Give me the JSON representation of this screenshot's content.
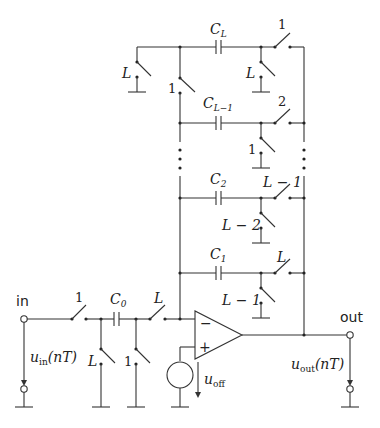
{
  "diagram": {
    "terminals": {
      "input_label": "in",
      "output_label": "out"
    },
    "signals": {
      "u_in": {
        "base": "u",
        "sub": "in",
        "arg": "(nT)"
      },
      "u_out": {
        "base": "u",
        "sub": "out",
        "arg": "(nT)"
      },
      "u_off": {
        "base": "u",
        "sub": "off"
      }
    },
    "capacitors": {
      "C0": {
        "base": "C",
        "sub": "0"
      },
      "C1": {
        "base": "C",
        "sub": "1"
      },
      "C2": {
        "base": "C",
        "sub": "2"
      },
      "CLm1": {
        "base": "C",
        "sub": "L−1"
      },
      "CL": {
        "base": "C",
        "sub": "L"
      }
    },
    "switch_labels": {
      "in_series": "1",
      "c0_out_series": "L",
      "c0_left_shunt": "L",
      "c0_right_shunt": "1",
      "cl_left_shunt": "L",
      "cl_mid_switch": "1",
      "cl_right_shunt": "L",
      "cl_series": "1",
      "clm1_series": "2",
      "clm1_shunt": "1",
      "c2_series": "L − 1",
      "c2_shunt": "L − 2",
      "c1_series": "L",
      "c1_shunt": "L − 1"
    },
    "opamp": {
      "inverting": "−",
      "non_inverting": "+"
    },
    "ellipsis": "⋮"
  }
}
